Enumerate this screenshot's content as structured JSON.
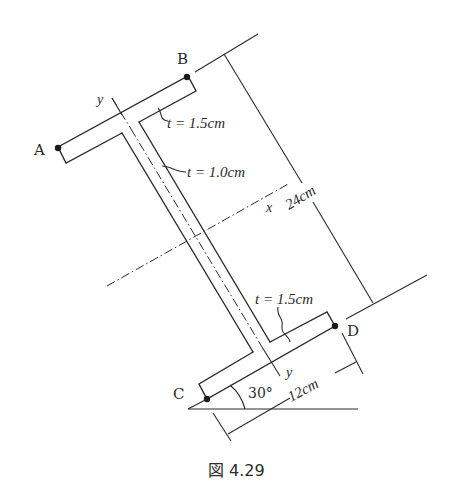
{
  "figure": {
    "caption": "図 4.29",
    "caption_prefix": "図",
    "caption_number": "4.29"
  },
  "section": {
    "type": "I-beam cross-section (inclined)",
    "points": {
      "A": "A",
      "B": "B",
      "C": "C",
      "D": "D"
    },
    "axes": {
      "x_label": "x",
      "y_label_top": "y",
      "y_label_bottom": "y"
    },
    "thickness_labels": {
      "top_flange": "t = 1.5cm",
      "web": "t = 1.0cm",
      "bottom_flange": "t = 1.5cm"
    },
    "dimensions": {
      "height": "24cm",
      "flange_width": "12cm",
      "angle": "30°"
    }
  },
  "colors": {
    "line": "#2b2b2b",
    "background": "#ffffff"
  }
}
